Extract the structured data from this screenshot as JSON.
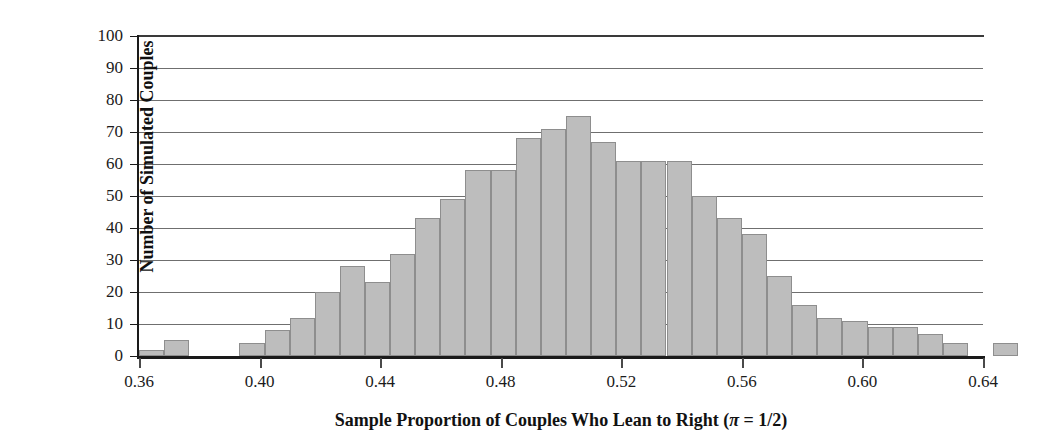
{
  "chart_data": {
    "type": "bar",
    "title": "",
    "subtitle": "",
    "xlabel": "Sample Proportion of Couples Who Lean to Right (π = 1/2)",
    "ylabel": "Number of Simulated Couples",
    "xlim": [
      0.36,
      0.64
    ],
    "ylim": [
      0,
      100
    ],
    "bin_width": 0.008333,
    "grid": true,
    "legend": null,
    "xticks": [
      "0.36",
      "0.40",
      "0.44",
      "0.48",
      "0.52",
      "0.56",
      "0.60",
      "0.64"
    ],
    "xtick_values": [
      0.36,
      0.4,
      0.44,
      0.48,
      0.52,
      0.56,
      0.6,
      0.64
    ],
    "yticks": [
      "0",
      "10",
      "20",
      "30",
      "40",
      "50",
      "60",
      "70",
      "80",
      "90",
      "100"
    ],
    "ytick_values": [
      0,
      10,
      20,
      30,
      40,
      50,
      60,
      70,
      80,
      90,
      100
    ],
    "bar_color": "#bdbdbd",
    "bar_edge_color": "#8e8e8e",
    "axis_color": "#1a1a1a",
    "grid_color": "#6f6f6f",
    "bins": [
      {
        "x0": 0.36,
        "x1": 0.3683,
        "count": 2
      },
      {
        "x0": 0.3683,
        "x1": 0.3767,
        "count": 5
      },
      {
        "x0": 0.3767,
        "x1": 0.385,
        "count": 0
      },
      {
        "x0": 0.385,
        "x1": 0.3933,
        "count": 0
      },
      {
        "x0": 0.3933,
        "x1": 0.4017,
        "count": 4
      },
      {
        "x0": 0.4017,
        "x1": 0.41,
        "count": 8
      },
      {
        "x0": 0.41,
        "x1": 0.4183,
        "count": 12
      },
      {
        "x0": 0.4183,
        "x1": 0.4267,
        "count": 20
      },
      {
        "x0": 0.4267,
        "x1": 0.435,
        "count": 28
      },
      {
        "x0": 0.435,
        "x1": 0.4433,
        "count": 23
      },
      {
        "x0": 0.4433,
        "x1": 0.4517,
        "count": 32
      },
      {
        "x0": 0.4517,
        "x1": 0.46,
        "count": 43
      },
      {
        "x0": 0.46,
        "x1": 0.4683,
        "count": 49
      },
      {
        "x0": 0.4683,
        "x1": 0.4767,
        "count": 58
      },
      {
        "x0": 0.4767,
        "x1": 0.485,
        "count": 58
      },
      {
        "x0": 0.485,
        "x1": 0.4933,
        "count": 68
      },
      {
        "x0": 0.4933,
        "x1": 0.5017,
        "count": 71
      },
      {
        "x0": 0.5017,
        "x1": 0.51,
        "count": 75
      },
      {
        "x0": 0.51,
        "x1": 0.5183,
        "count": 67
      },
      {
        "x0": 0.5183,
        "x1": 0.5267,
        "count": 61
      },
      {
        "x0": 0.5267,
        "x1": 0.535,
        "count": 61
      },
      {
        "x0": 0.535,
        "x1": 0.5433,
        "count": 61
      },
      {
        "x0": 0.5433,
        "x1": 0.5517,
        "count": 50
      },
      {
        "x0": 0.5517,
        "x1": 0.56,
        "count": 43
      },
      {
        "x0": 0.56,
        "x1": 0.5683,
        "count": 38
      },
      {
        "x0": 0.5683,
        "x1": 0.5767,
        "count": 25
      },
      {
        "x0": 0.5767,
        "x1": 0.585,
        "count": 16
      },
      {
        "x0": 0.585,
        "x1": 0.5933,
        "count": 12
      },
      {
        "x0": 0.5933,
        "x1": 0.6017,
        "count": 11
      },
      {
        "x0": 0.6017,
        "x1": 0.61,
        "count": 9
      },
      {
        "x0": 0.61,
        "x1": 0.6183,
        "count": 9
      },
      {
        "x0": 0.6183,
        "x1": 0.6267,
        "count": 7
      },
      {
        "x0": 0.6267,
        "x1": 0.635,
        "count": 4
      },
      {
        "x0": 0.635,
        "x1": 0.6433,
        "count": 0
      },
      {
        "x0": 0.6433,
        "x1": 0.6517,
        "count": 4
      }
    ]
  }
}
